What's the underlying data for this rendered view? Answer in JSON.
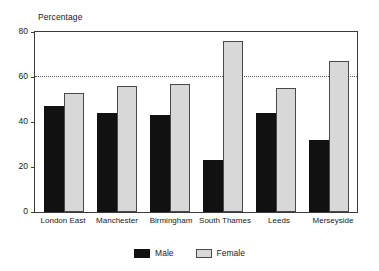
{
  "chart_data": {
    "type": "bar",
    "title": "",
    "subtitle": "",
    "xlabel": "",
    "ylabel": "Percentage",
    "ylim": [
      0,
      80
    ],
    "yticks": [
      0,
      20,
      40,
      60,
      80
    ],
    "gridlines": [
      60
    ],
    "grid": "dotted horizontal line at 60 only",
    "legend_position": "bottom-center",
    "categories": [
      "London East",
      "Manchester",
      "Birmingham",
      "South Thames",
      "Leeds",
      "Merseyside"
    ],
    "series": [
      {
        "name": "Male",
        "color": "#111111",
        "values": [
          47,
          44,
          43,
          23,
          44,
          32
        ]
      },
      {
        "name": "Female",
        "color": "#d8d8d8",
        "values": [
          53,
          56,
          57,
          76,
          55,
          67
        ]
      }
    ]
  },
  "axis": {
    "y_title": "Percentage",
    "tick_labels": [
      "80",
      "60",
      "40",
      "20",
      "0"
    ]
  },
  "legend": {
    "items": [
      {
        "label": "Male",
        "swatch": "black-square-swatch"
      },
      {
        "label": "Female",
        "swatch": "light-gray-square-swatch"
      }
    ]
  },
  "colors": {
    "male": "#111111",
    "female": "#d8d8d8",
    "female_border": "#4a4a4a",
    "frame": "#3a3a3a",
    "gridline": "#555555",
    "text": "#1a1a1a",
    "background": "#ffffff"
  }
}
